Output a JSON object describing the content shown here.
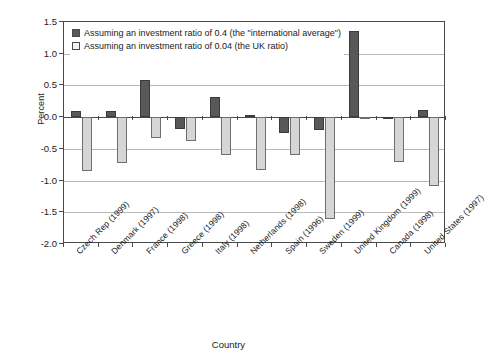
{
  "chart_data": {
    "type": "bar",
    "title": "",
    "xlabel": "Country",
    "ylabel": "Percent",
    "ylim": [
      -2.0,
      1.5
    ],
    "yticks": [
      "1.5",
      "1.0",
      "0.5",
      "0.0",
      "-0.5",
      "-1.0",
      "-1.5",
      "-2.0"
    ],
    "ytick_values": [
      1.5,
      1.0,
      0.5,
      0.0,
      -0.5,
      -1.0,
      -1.5,
      -2.0
    ],
    "grid": true,
    "legend_position": "upper-left-inside",
    "categories": [
      "Czech Rep (1999)",
      "Denmark (1997)",
      "France (1998)",
      "Greece (1998)",
      "Italy (1998)",
      "Netherlands (1998)",
      "Spain (1996)",
      "Sweden (1999)",
      "United Kingdom (1999)",
      "Canada (1998)",
      "United States (1997)"
    ],
    "series": [
      {
        "name": "Assuming an investment ratio of 0.4 (the \"international average\")",
        "color": "#585858",
        "values": [
          0.1,
          0.09,
          0.58,
          -0.18,
          0.32,
          0.04,
          -0.25,
          -0.2,
          1.36,
          -0.02,
          0.12
        ]
      },
      {
        "name": "Assuming an investment ratio of 0.04 (the UK ratio)",
        "color": "#d6d6d6",
        "values": [
          -0.85,
          -0.72,
          -0.33,
          -0.38,
          -0.6,
          -0.83,
          -0.6,
          -1.6,
          -0.01,
          -0.7,
          -1.08
        ]
      }
    ]
  },
  "legend": {
    "items": [
      {
        "label": "Assuming an investment ratio of 0.4 (the \"international average\")",
        "swatch": "dark"
      },
      {
        "label": "Assuming an investment ratio of 0.04 (the UK ratio)",
        "swatch": "light"
      }
    ]
  },
  "axes": {
    "y_title": "Percent",
    "x_title": "Country"
  }
}
